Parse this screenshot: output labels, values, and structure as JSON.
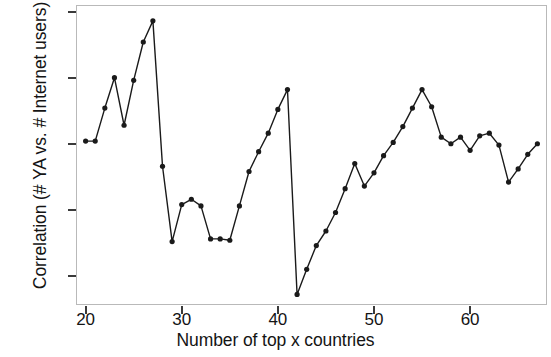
{
  "chart_data": {
    "type": "line",
    "title": "",
    "xlabel": "Number of top x countries",
    "ylabel": "Correlation (# YA vs. # Internet users)",
    "xlim": [
      19,
      68
    ],
    "ylim": [
      0.478,
      0.705
    ],
    "xticks": [
      20,
      30,
      40,
      50,
      60
    ],
    "yticks": [
      0.5,
      0.55,
      0.6,
      0.65,
      0.7
    ],
    "ytick_labels": [
      "0.50",
      "0.55",
      "0.60",
      "0.65",
      "0.70"
    ],
    "xtick_labels": [
      "20",
      "30",
      "40",
      "50",
      "60"
    ],
    "grid": false,
    "legend": null,
    "marker": "filled-circle",
    "line_color": "#1a1a1a",
    "marker_color": "#1a1a1a",
    "x": [
      20,
      21,
      22,
      23,
      24,
      25,
      26,
      27,
      28,
      29,
      30,
      31,
      32,
      33,
      34,
      35,
      36,
      37,
      38,
      39,
      40,
      41,
      42,
      43,
      44,
      45,
      46,
      47,
      48,
      49,
      50,
      51,
      52,
      53,
      54,
      55,
      56,
      57,
      58,
      59,
      60,
      61,
      62,
      63,
      64,
      65,
      66,
      67
    ],
    "values": [
      0.602,
      0.602,
      0.627,
      0.65,
      0.614,
      0.648,
      0.677,
      0.693,
      0.583,
      0.526,
      0.554,
      0.558,
      0.553,
      0.528,
      0.528,
      0.527,
      0.553,
      0.579,
      0.594,
      0.608,
      0.626,
      0.641,
      0.486,
      0.505,
      0.523,
      0.534,
      0.548,
      0.566,
      0.585,
      0.568,
      0.578,
      0.591,
      0.601,
      0.613,
      0.627,
      0.641,
      0.628,
      0.605,
      0.6,
      0.605,
      0.595,
      0.606,
      0.608,
      0.599,
      0.571,
      0.581,
      0.592,
      0.6
    ]
  },
  "axes": {
    "x_label": "Number of top x countries",
    "y_label": "Correlation (# YA vs. # Internet users)"
  }
}
